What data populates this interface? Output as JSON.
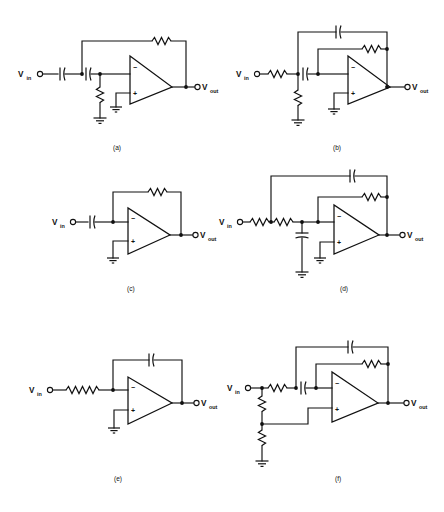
{
  "figure": {
    "background_color": "#ffffff",
    "ink_color": "#111111",
    "width": 444,
    "height": 512
  },
  "labels": {
    "vin_main": "V",
    "vin_sub": "in",
    "vout_main": "V",
    "vout_sub": "out",
    "inverting_pin": "−",
    "noninverting_pin": "+"
  },
  "circuits": [
    {
      "id": "a",
      "caption": "(a)",
      "input_label_main": "V",
      "input_label_sub": "in",
      "output_label_main": "V",
      "output_label_sub": "out",
      "topology": "Series input capacitor pair with shunt resistor to ground, resistive feedback, non-inverting input grounded",
      "components": [
        {
          "name": "input-capacitor-1",
          "type": "capacitor",
          "orientation": "horizontal"
        },
        {
          "name": "input-capacitor-2",
          "type": "capacitor",
          "orientation": "horizontal"
        },
        {
          "name": "shunt-resistor",
          "type": "resistor",
          "orientation": "vertical"
        },
        {
          "name": "feedback-resistor",
          "type": "resistor",
          "orientation": "horizontal"
        },
        {
          "name": "ground-shunt",
          "type": "ground"
        },
        {
          "name": "ground-noninverting",
          "type": "ground"
        }
      ]
    },
    {
      "id": "b",
      "caption": "(b)",
      "input_label_main": "V",
      "input_label_sub": "in",
      "output_label_main": "V",
      "output_label_sub": "out",
      "topology": "Series input resistor then capacitor, shunt resistor to ground, parallel capacitor and resistor feedback",
      "components": [
        {
          "name": "input-resistor",
          "type": "resistor",
          "orientation": "horizontal"
        },
        {
          "name": "series-capacitor",
          "type": "capacitor",
          "orientation": "horizontal"
        },
        {
          "name": "shunt-resistor",
          "type": "resistor",
          "orientation": "vertical"
        },
        {
          "name": "feedback-capacitor",
          "type": "capacitor",
          "orientation": "horizontal"
        },
        {
          "name": "feedback-resistor",
          "type": "resistor",
          "orientation": "horizontal"
        },
        {
          "name": "ground-shunt",
          "type": "ground"
        },
        {
          "name": "ground-noninverting",
          "type": "ground"
        }
      ]
    },
    {
      "id": "c",
      "caption": "(c)",
      "input_label_main": "V",
      "input_label_sub": "in",
      "output_label_main": "V",
      "output_label_sub": "out",
      "topology": "Single series input capacitor with resistive feedback - differentiator",
      "components": [
        {
          "name": "input-capacitor",
          "type": "capacitor",
          "orientation": "horizontal"
        },
        {
          "name": "feedback-resistor",
          "type": "resistor",
          "orientation": "horizontal"
        },
        {
          "name": "ground-noninverting",
          "type": "ground"
        }
      ]
    },
    {
      "id": "d",
      "caption": "(d)",
      "input_label_main": "V",
      "input_label_sub": "in",
      "output_label_main": "V",
      "output_label_sub": "out",
      "topology": "Two series input resistors, shunt capacitor to ground, parallel capacitor and resistor feedback",
      "components": [
        {
          "name": "input-resistor-1",
          "type": "resistor",
          "orientation": "horizontal"
        },
        {
          "name": "input-resistor-2",
          "type": "resistor",
          "orientation": "horizontal"
        },
        {
          "name": "shunt-capacitor",
          "type": "capacitor",
          "orientation": "vertical"
        },
        {
          "name": "feedback-capacitor",
          "type": "capacitor",
          "orientation": "horizontal"
        },
        {
          "name": "feedback-resistor",
          "type": "resistor",
          "orientation": "horizontal"
        },
        {
          "name": "ground-shunt",
          "type": "ground"
        },
        {
          "name": "ground-noninverting",
          "type": "ground"
        }
      ]
    },
    {
      "id": "e",
      "caption": "(e)",
      "input_label_main": "V",
      "input_label_sub": "in",
      "output_label_main": "V",
      "output_label_sub": "out",
      "topology": "Long series input resistor with capacitive feedback - integrator",
      "components": [
        {
          "name": "input-resistor",
          "type": "resistor",
          "orientation": "horizontal"
        },
        {
          "name": "feedback-capacitor",
          "type": "capacitor",
          "orientation": "horizontal"
        },
        {
          "name": "ground-noninverting",
          "type": "ground"
        }
      ]
    },
    {
      "id": "f",
      "caption": "(f)",
      "input_label_main": "V",
      "input_label_sub": "in",
      "output_label_main": "V",
      "output_label_sub": "out",
      "topology": "Input resistor and series capacitor with parallel capacitor and resistor feedback, resistive divider biasing non-inverting input",
      "components": [
        {
          "name": "series-resistor",
          "type": "resistor",
          "orientation": "horizontal"
        },
        {
          "name": "series-capacitor",
          "type": "capacitor",
          "orientation": "horizontal"
        },
        {
          "name": "divider-resistor-upper",
          "type": "resistor",
          "orientation": "vertical"
        },
        {
          "name": "divider-resistor-lower",
          "type": "resistor",
          "orientation": "vertical"
        },
        {
          "name": "feedback-capacitor",
          "type": "capacitor",
          "orientation": "horizontal"
        },
        {
          "name": "feedback-resistor",
          "type": "resistor",
          "orientation": "horizontal"
        },
        {
          "name": "ground-divider",
          "type": "ground"
        }
      ]
    }
  ]
}
